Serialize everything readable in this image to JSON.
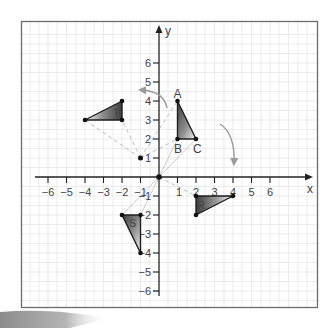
{
  "figure": {
    "axes": {
      "x_label": "x",
      "y_label": "y",
      "x_ticks": [
        {
          "value": -6,
          "label": "−6"
        },
        {
          "value": -5,
          "label": "−5"
        },
        {
          "value": -4,
          "label": "−4"
        },
        {
          "value": -3,
          "label": "−3"
        },
        {
          "value": -2,
          "label": "−2"
        },
        {
          "value": -1,
          "label": "−1"
        },
        {
          "value": 1,
          "label": "1"
        },
        {
          "value": 2,
          "label": "2"
        },
        {
          "value": 3,
          "label": "3"
        },
        {
          "value": 4,
          "label": "4"
        },
        {
          "value": 5,
          "label": "5"
        },
        {
          "value": 6,
          "label": "6"
        }
      ],
      "y_ticks": [
        {
          "value": 6,
          "label": "6"
        },
        {
          "value": 5,
          "label": "5"
        },
        {
          "value": 4,
          "label": "4"
        },
        {
          "value": 3,
          "label": "3"
        },
        {
          "value": 2,
          "label": "2"
        },
        {
          "value": 1,
          "label": "1"
        },
        {
          "value": -1,
          "label": "−1"
        },
        {
          "value": -2,
          "label": "−2"
        },
        {
          "value": -3,
          "label": "−3"
        },
        {
          "value": -4,
          "label": "−4"
        },
        {
          "value": -5,
          "label": "−5"
        },
        {
          "value": -6,
          "label": "−6"
        }
      ]
    },
    "shapes": {
      "abc": {
        "vertex_labels": [
          "A",
          "B",
          "C"
        ],
        "vertices": [
          [
            1,
            4
          ],
          [
            1,
            2
          ],
          [
            2,
            2
          ]
        ]
      },
      "t": {
        "label": "T",
        "vertices": [
          [
            -4,
            3
          ],
          [
            -2,
            4
          ],
          [
            -2,
            3
          ]
        ]
      },
      "s": {
        "label": "S",
        "vertices": [
          [
            -2,
            -2
          ],
          [
            -1,
            -2
          ],
          [
            -1,
            -4
          ]
        ]
      },
      "r": {
        "label": "R",
        "vertices": [
          [
            2,
            -1
          ],
          [
            4,
            -1
          ],
          [
            2,
            -2
          ]
        ]
      }
    },
    "points": {
      "origin": [
        0,
        0
      ],
      "center_of_rotation": [
        -1,
        1
      ]
    },
    "arrows": {
      "counterclockwise": "rotation-anticlockwise",
      "clockwise": "rotation-clockwise"
    },
    "colors": {
      "grid": "#e4e4e4",
      "frame": "#6b6b6b",
      "axis": "#222222",
      "construction_line": "#b8b8b8",
      "arrow": "#9a9a9a",
      "fill_dark": "#4a4a4a",
      "fill_light": "#ffffff"
    }
  }
}
